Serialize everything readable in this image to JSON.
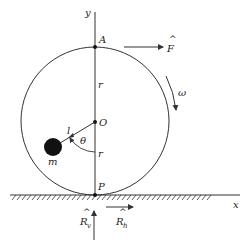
{
  "diagram": {
    "type": "physics-free-body",
    "colors": {
      "stroke": "#333333",
      "fill_mass": "#111111",
      "background": "#ffffff"
    },
    "labels": {
      "y_axis": "y",
      "x_axis": "x",
      "point_A": "A",
      "point_O": "O",
      "point_P": "P",
      "radius_upper": "r",
      "radius_lower": "r",
      "angle": "θ",
      "arm_length": "l",
      "mass": "m",
      "angular_velocity": "ω",
      "force_F": "F",
      "reaction_vertical": "R",
      "reaction_vertical_sub": "v",
      "reaction_horizontal": "R",
      "reaction_horizontal_sub": "h",
      "hat": "^"
    }
  }
}
